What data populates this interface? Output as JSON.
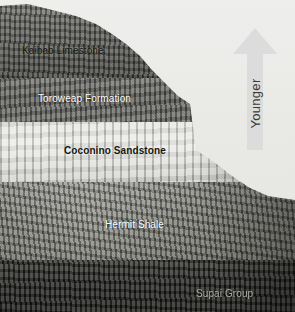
{
  "figure": {
    "type": "geologic-strata-photo"
  },
  "strata_labels": [
    {
      "name": "kaibab-limestone",
      "text": "Kaibab Limestone",
      "style": "dark"
    },
    {
      "name": "toroweap-formation",
      "text": "Toroweap Formation",
      "style": "light"
    },
    {
      "name": "coconino-sandstone",
      "text": "Coconino Sandstone",
      "style": "dark"
    },
    {
      "name": "hermit-shale",
      "text": "Hermit Shale",
      "style": "light"
    },
    {
      "name": "supai-group",
      "text": "Supai Group",
      "style": "faint"
    }
  ],
  "direction_arrow": {
    "label": "Younger",
    "points": "up",
    "color": "#dcdcdc"
  },
  "colors": {
    "sky": "#ebebe8",
    "arrow": "#dcdcdc",
    "label_dark": "#15150f",
    "label_light": "#fdfdfa"
  }
}
